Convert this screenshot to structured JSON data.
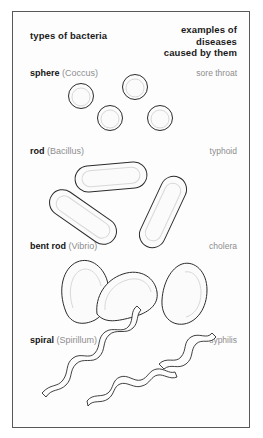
{
  "figure": {
    "headers": {
      "left": "types of bacteria",
      "right_lines": [
        "examples of",
        "diseases",
        "caused by them"
      ]
    },
    "rows": [
      {
        "name": "sphere",
        "latin": "(Coccus)",
        "disease": "sore throat",
        "shape": "circles"
      },
      {
        "name": "rod",
        "latin": "(Bacillus)",
        "disease": "typhoid",
        "shape": "capsules"
      },
      {
        "name": "bent rod",
        "latin": "(Vibrio)",
        "disease": "cholera",
        "shape": "curved-rods"
      },
      {
        "name": "spiral",
        "latin": "(Spirillum)",
        "disease": "syphilis",
        "shape": "squiggles"
      }
    ],
    "colors": {
      "border": "#58585a",
      "text": "#1a1a1a",
      "muted_text": "#8d8d8f",
      "outline": "#2b2b2b",
      "fill": "#fbfbfb",
      "background": "#ffffff"
    }
  }
}
